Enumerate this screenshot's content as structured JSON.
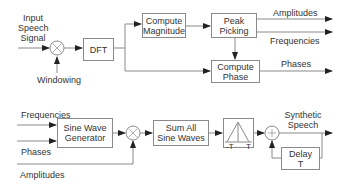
{
  "analysis": {
    "input_label": [
      "Input",
      "Speech",
      "Signal"
    ],
    "windowing_label": "Windowing",
    "multiply_symbol": "×",
    "dft_label": "DFT",
    "compute_magnitude": [
      "Compute",
      "Magnitude"
    ],
    "peak_picking": [
      "Peak",
      "Picking"
    ],
    "compute_phase": [
      "Compute",
      "Phase"
    ],
    "outputs": {
      "amplitudes": "Amplitudes",
      "frequencies": "Frequencies",
      "phases": "Phases"
    }
  },
  "synthesis": {
    "inputs": {
      "frequencies": "Frequencies",
      "phases": "Phases",
      "amplitudes": "Amplitudes"
    },
    "sine_wave_generator": [
      "Sine Wave",
      "Generator"
    ],
    "multiply_symbol": "×",
    "sum_all_sine_waves": [
      "Sum All",
      "Sine Waves"
    ],
    "window_labels": {
      "left": "-T",
      "right": "T"
    },
    "adder_symbol": "+",
    "output_label": [
      "Synthetic",
      "Speech"
    ],
    "delay": [
      "Delay",
      "T"
    ]
  },
  "colors": {
    "line": "#8a8a8a",
    "arrow": "#222222",
    "text": "#333333"
  }
}
